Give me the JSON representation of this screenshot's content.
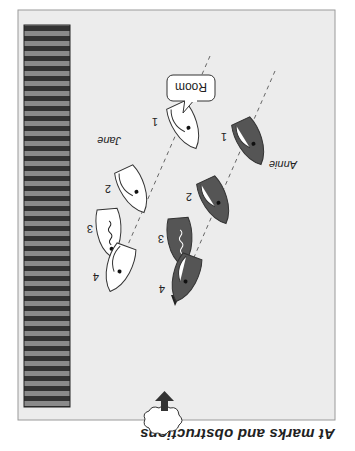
{
  "figure": {
    "title": "At marks and obstructions",
    "orientation": "rotated 180 degrees",
    "colors": {
      "panel_bg": "#ececec",
      "panel_border": "#9a9a9a",
      "boat_light": "#ffffff",
      "boat_dark": "#555555",
      "stripe_dark": "#333333",
      "stripe_light": "#8a8a8a",
      "arrow": "#333333"
    },
    "callout": {
      "label": "Room"
    },
    "boats": [
      {
        "name": "Jane",
        "fill": "light",
        "positions": [
          "1",
          "2",
          "3",
          "4"
        ]
      },
      {
        "name": "Annie",
        "fill": "dark",
        "positions": [
          "1",
          "2",
          "3",
          "4"
        ]
      }
    ],
    "labels": {
      "jane": "Jane",
      "annie": "Annie",
      "jane_p1": "1",
      "jane_p2": "2",
      "jane_p3": "3",
      "jane_p4": "4",
      "annie_p1": "1",
      "annie_p2": "2",
      "annie_p3": "3",
      "annie_p4": "4"
    },
    "wind_indicator": "cloud-with-arrow"
  }
}
